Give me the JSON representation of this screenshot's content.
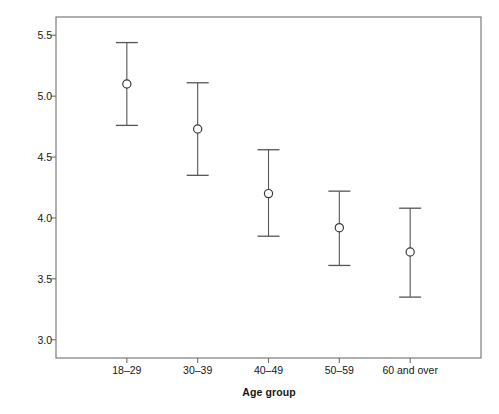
{
  "chart_data": {
    "type": "scatter",
    "title": "",
    "xlabel": "Age group",
    "ylabel": "95% CI satisfaction",
    "categories": [
      "18–29",
      "30–39",
      "40–49",
      "50–59",
      "60 and over"
    ],
    "values": [
      5.1,
      4.73,
      4.2,
      3.92,
      3.72
    ],
    "ci_lower": [
      4.76,
      4.35,
      3.85,
      3.61,
      3.35
    ],
    "ci_upper": [
      5.44,
      5.11,
      4.56,
      4.22,
      4.08
    ],
    "series": [
      {
        "name": "95% CI satisfaction",
        "points": [
          {
            "category": "18–29",
            "mean": 5.1,
            "lower": 4.76,
            "upper": 5.44
          },
          {
            "category": "30–39",
            "mean": 4.73,
            "lower": 4.35,
            "upper": 5.11
          },
          {
            "category": "40–49",
            "mean": 4.2,
            "lower": 3.85,
            "upper": 4.56
          },
          {
            "category": "50–59",
            "mean": 3.92,
            "lower": 3.61,
            "upper": 4.22
          },
          {
            "category": "60 and over",
            "mean": 3.72,
            "lower": 3.35,
            "upper": 4.08
          }
        ]
      }
    ],
    "ylim": [
      2.85,
      5.65
    ],
    "yticks": [
      3.0,
      3.5,
      4.0,
      4.5,
      5.0,
      5.5
    ],
    "ytick_labels": [
      "3.0",
      "3.5",
      "4.0",
      "4.5",
      "5.0",
      "5.5"
    ],
    "grid": false,
    "legend": "none",
    "marker": "open-circle",
    "errorbar_cap": "flat"
  },
  "axes": {
    "y_title": "95% CI satisfaction",
    "x_title": "Age group"
  },
  "colors": {
    "frame": "#6f6f6f",
    "marker": "#3a3a3a",
    "errorbar": "#555555",
    "text": "#161616",
    "background": "#ffffff"
  }
}
